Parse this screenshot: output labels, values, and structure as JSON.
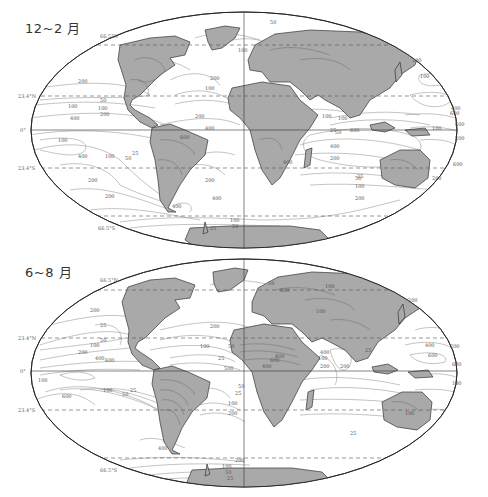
{
  "figure": {
    "panels": [
      {
        "id": "djf",
        "title": "12~2 月",
        "latitude_labels": {
          "arctic": "66.5°N",
          "tropic_n": "23.4°N",
          "equator": "0°",
          "tropic_s": "23.4°S",
          "antarctic": "66.5°S"
        },
        "contour_labels": [
          {
            "value": "200",
            "region": "north-pacific-east"
          },
          {
            "value": "100",
            "region": "north-pacific-east"
          },
          {
            "value": "50",
            "region": "east-pacific"
          },
          {
            "value": "100",
            "region": "east-pacific"
          },
          {
            "value": "200",
            "region": "east-pacific"
          },
          {
            "value": "400",
            "region": "central-pacific"
          },
          {
            "value": "100",
            "region": "south-pacific"
          },
          {
            "value": "400",
            "region": "south-pacific"
          },
          {
            "value": "100",
            "region": "south-pacific"
          },
          {
            "value": "50",
            "region": "south-pacific"
          },
          {
            "value": "25",
            "region": "south-pacific"
          },
          {
            "value": "200",
            "region": "south-pacific"
          },
          {
            "value": "200",
            "region": "south-pacific-south"
          },
          {
            "value": "600",
            "region": "south-america"
          },
          {
            "value": "400",
            "region": "south-america-north"
          },
          {
            "value": "400",
            "region": "patagonia"
          },
          {
            "value": "200",
            "region": "south-atlantic"
          },
          {
            "value": "400",
            "region": "south-atlantic"
          },
          {
            "value": "100",
            "region": "southern-ocean"
          },
          {
            "value": "50",
            "region": "southern-ocean"
          },
          {
            "value": "25",
            "region": "southern-ocean"
          },
          {
            "value": "200",
            "region": "north-atlantic"
          },
          {
            "value": "100",
            "region": "north-atlantic"
          },
          {
            "value": "200",
            "region": "caribbean"
          },
          {
            "value": "50",
            "region": "arctic"
          },
          {
            "value": "100",
            "region": "greenland-sea"
          },
          {
            "value": "400",
            "region": "africa-south"
          },
          {
            "value": "600",
            "region": "indian-ocean"
          },
          {
            "value": "400",
            "region": "indian-ocean"
          },
          {
            "value": "200",
            "region": "indian-ocean"
          },
          {
            "value": "50",
            "region": "indian-ocean"
          },
          {
            "value": "25",
            "region": "indian-ocean"
          },
          {
            "value": "100",
            "region": "indian-ocean-south"
          },
          {
            "value": "200",
            "region": "indian-ocean-south"
          },
          {
            "value": "600",
            "region": "maritime-continent"
          },
          {
            "value": "200",
            "region": "west-pacific"
          },
          {
            "value": "100",
            "region": "west-pacific"
          },
          {
            "value": "200",
            "region": "north-pacific-west"
          },
          {
            "value": "100",
            "region": "north-pacific-west"
          },
          {
            "value": "600",
            "region": "west-pacific-equatorial"
          },
          {
            "value": "400",
            "region": "west-pacific-equatorial"
          },
          {
            "value": "600",
            "region": "south-west-pacific"
          },
          {
            "value": "200",
            "region": "tasman"
          },
          {
            "value": "100",
            "region": "asia"
          },
          {
            "value": "25",
            "region": "arabian-sea"
          },
          {
            "value": "50",
            "region": "arabian-sea"
          },
          {
            "value": "100",
            "region": "arabian-sea"
          }
        ]
      },
      {
        "id": "jja",
        "title": "6~8 月",
        "latitude_labels": {
          "arctic": "66.5°N",
          "tropic_n": "23.4°N",
          "equator": "0°",
          "tropic_s": "23.4°S",
          "antarctic": "66.5°S"
        },
        "contour_labels": [
          {
            "value": "200",
            "region": "north-pacific-east"
          },
          {
            "value": "25",
            "region": "east-pacific"
          },
          {
            "value": "50",
            "region": "east-pacific"
          },
          {
            "value": "100",
            "region": "east-pacific"
          },
          {
            "value": "200",
            "region": "east-pacific"
          },
          {
            "value": "400",
            "region": "east-pacific"
          },
          {
            "value": "600",
            "region": "central-pacific"
          },
          {
            "value": "100",
            "region": "south-pacific"
          },
          {
            "value": "600",
            "region": "south-pacific"
          },
          {
            "value": "100",
            "region": "south-pacific"
          },
          {
            "value": "50",
            "region": "south-pacific"
          },
          {
            "value": "25",
            "region": "south-pacific"
          },
          {
            "value": "400",
            "region": "south-pacific-south"
          },
          {
            "value": "200",
            "region": "southern-ocean"
          },
          {
            "value": "100",
            "region": "southern-ocean"
          },
          {
            "value": "50",
            "region": "southern-ocean"
          },
          {
            "value": "25",
            "region": "southern-ocean"
          },
          {
            "value": "200",
            "region": "north-atlantic"
          },
          {
            "value": "100",
            "region": "north-atlantic"
          },
          {
            "value": "50",
            "region": "north-atlantic"
          },
          {
            "value": "25",
            "region": "north-atlantic"
          },
          {
            "value": "50",
            "region": "arctic"
          },
          {
            "value": "500",
            "region": "atlantic-equatorial"
          },
          {
            "value": "100",
            "region": "south-atlantic"
          },
          {
            "value": "200",
            "region": "south-atlantic"
          },
          {
            "value": "50",
            "region": "south-atlantic"
          },
          {
            "value": "25",
            "region": "south-atlantic"
          },
          {
            "value": "400",
            "region": "west-africa"
          },
          {
            "value": "600",
            "region": "west-africa"
          },
          {
            "value": "800",
            "region": "central-africa"
          },
          {
            "value": "600",
            "region": "europe"
          },
          {
            "value": "100",
            "region": "central-asia"
          },
          {
            "value": "100",
            "region": "siberia"
          },
          {
            "value": "200",
            "region": "north-pacific-west"
          },
          {
            "value": "400",
            "region": "west-pacific"
          },
          {
            "value": "600",
            "region": "west-pacific"
          },
          {
            "value": "200",
            "region": "west-pacific"
          },
          {
            "value": "200",
            "region": "indian-ocean"
          },
          {
            "value": "100",
            "region": "arabian-sea"
          },
          {
            "value": "200",
            "region": "arabian-sea"
          },
          {
            "value": "400",
            "region": "arabian-sea"
          },
          {
            "value": "25",
            "region": "bay-of-bengal"
          },
          {
            "value": "600",
            "region": "south-west-pacific"
          },
          {
            "value": "100",
            "region": "south-west-pacific"
          },
          {
            "value": "100",
            "region": "australia"
          },
          {
            "value": "25",
            "region": "south-pacific-east"
          }
        ]
      }
    ]
  }
}
